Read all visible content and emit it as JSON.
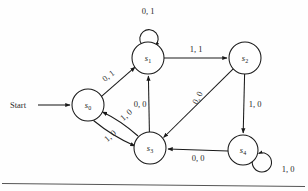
{
  "diagram": {
    "type": "state-transition-diagram",
    "start_label": "Start",
    "background_color": "#fefefe",
    "stroke_color": "#1a1a1a",
    "states": [
      {
        "id": "s0",
        "name": "s",
        "sub": "0",
        "cx": 88,
        "cy": 105,
        "r": 16
      },
      {
        "id": "s1",
        "name": "s",
        "sub": "1",
        "cx": 148,
        "cy": 58,
        "r": 16
      },
      {
        "id": "s2",
        "name": "s",
        "sub": "2",
        "cx": 245,
        "cy": 58,
        "r": 16
      },
      {
        "id": "s3",
        "name": "s",
        "sub": "3",
        "cx": 150,
        "cy": 148,
        "r": 16
      },
      {
        "id": "s4",
        "name": "s",
        "sub": "4",
        "cx": 243,
        "cy": 150,
        "r": 15
      }
    ],
    "transitions": [
      {
        "id": "t-start-s0",
        "from": "start",
        "to": "s0",
        "label": "",
        "lx": 0,
        "ly": 0,
        "rotate": 0
      },
      {
        "id": "t-s0-s1",
        "from": "s0",
        "to": "s1",
        "label": "0, 1",
        "lx": 110,
        "ly": 78,
        "rotate": -38
      },
      {
        "id": "t-s1-s1",
        "from": "s1",
        "to": "s1",
        "label": "0, 1",
        "lx": 148,
        "ly": 14,
        "rotate": 0
      },
      {
        "id": "t-s1-s2",
        "from": "s1",
        "to": "s2",
        "label": "1, 1",
        "lx": 196,
        "ly": 52,
        "rotate": 0
      },
      {
        "id": "t-s2-s3",
        "from": "s2",
        "to": "s3",
        "label": "0, 0",
        "lx": 200,
        "ly": 99,
        "rotate": -63
      },
      {
        "id": "t-s2-s4",
        "from": "s2",
        "to": "s4",
        "label": "1, 0",
        "lx": 255,
        "ly": 107,
        "rotate": 0
      },
      {
        "id": "t-s3-s1",
        "from": "s3",
        "to": "s1",
        "label": "0, 0",
        "lx": 140,
        "ly": 107,
        "rotate": 0
      },
      {
        "id": "t-s3-s0",
        "from": "s3",
        "to": "s0",
        "label": "1, 0",
        "lx": 128,
        "ly": 117,
        "rotate": -42
      },
      {
        "id": "t-s0-s3",
        "from": "s0",
        "to": "s3",
        "label": "1, 0",
        "lx": 112,
        "ly": 138,
        "rotate": -42
      },
      {
        "id": "t-s4-s3",
        "from": "s4",
        "to": "s3",
        "label": "0, 0",
        "lx": 198,
        "ly": 161,
        "rotate": 0
      },
      {
        "id": "t-s4-s4",
        "from": "s4",
        "to": "s4",
        "label": "1, 0",
        "lx": 288,
        "ly": 172,
        "rotate": 0
      }
    ]
  }
}
